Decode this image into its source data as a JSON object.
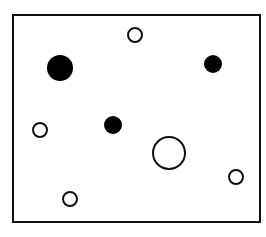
{
  "diagram": {
    "width": 266,
    "height": 237,
    "stroke_color": "#111111",
    "fill_color": "#000000",
    "background": "#ffffff",
    "frame": {
      "x": 13,
      "y": 15,
      "width": 247,
      "height": 207,
      "stroke_width": 2
    },
    "circles": [
      {
        "id": "large-filled",
        "cx": 60,
        "cy": 68,
        "r": 13,
        "filled": true
      },
      {
        "id": "small-open-top",
        "cx": 135,
        "cy": 35,
        "r": 7,
        "filled": false
      },
      {
        "id": "medium-filled-right",
        "cx": 213,
        "cy": 64,
        "r": 9,
        "filled": true
      },
      {
        "id": "small-open-left",
        "cx": 40,
        "cy": 130,
        "r": 7,
        "filled": false
      },
      {
        "id": "medium-filled-center",
        "cx": 113,
        "cy": 125,
        "r": 9,
        "filled": true
      },
      {
        "id": "large-open",
        "cx": 169,
        "cy": 153,
        "r": 16,
        "filled": false
      },
      {
        "id": "small-open-bottom-right",
        "cx": 236,
        "cy": 177,
        "r": 7,
        "filled": false
      },
      {
        "id": "small-open-bottom",
        "cx": 70,
        "cy": 199,
        "r": 7,
        "filled": false
      }
    ]
  }
}
